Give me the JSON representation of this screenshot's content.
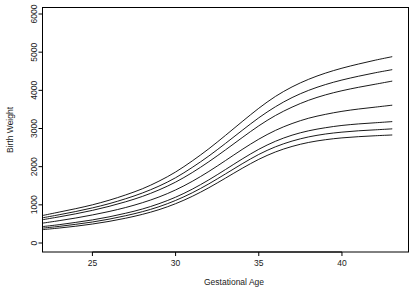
{
  "chart_data": {
    "type": "line",
    "title": "",
    "xlabel": "Gestational Age",
    "ylabel": "Birth Weight",
    "xlim": [
      22,
      44
    ],
    "ylim": [
      0,
      6000
    ],
    "xticks": [
      25,
      30,
      35,
      40
    ],
    "yticks": [
      0,
      1000,
      2000,
      3000,
      4000,
      5000,
      6000
    ],
    "xtick_labels": [
      "25",
      "30",
      "35",
      "40"
    ],
    "ytick_labels": [
      "0",
      "1000",
      "2000",
      "3000",
      "4000",
      "5000",
      "6000"
    ],
    "grid": false,
    "legend": false,
    "line_color": "#000000",
    "box_color": "#000000",
    "x": [
      22,
      23,
      24,
      25,
      26,
      27,
      28,
      29,
      30,
      31,
      32,
      33,
      34,
      35,
      36,
      37,
      38,
      39,
      40,
      41,
      42,
      43
    ],
    "series": [
      {
        "name": "curve-1",
        "values": [
          720,
          810,
          900,
          1000,
          1120,
          1260,
          1420,
          1620,
          1860,
          2150,
          2470,
          2820,
          3180,
          3530,
          3840,
          4090,
          4290,
          4450,
          4580,
          4690,
          4790,
          4880
        ]
      },
      {
        "name": "curve-2",
        "values": [
          660,
          740,
          825,
          920,
          1030,
          1160,
          1310,
          1490,
          1710,
          1980,
          2280,
          2610,
          2950,
          3280,
          3570,
          3810,
          4000,
          4150,
          4270,
          4370,
          4460,
          4540
        ]
      },
      {
        "name": "curve-3",
        "values": [
          610,
          685,
          765,
          855,
          960,
          1080,
          1220,
          1390,
          1595,
          1845,
          2130,
          2440,
          2760,
          3070,
          3340,
          3560,
          3740,
          3880,
          3990,
          4080,
          4160,
          4240
        ]
      },
      {
        "name": "curve-4",
        "values": [
          520,
          585,
          655,
          735,
          825,
          930,
          1055,
          1205,
          1390,
          1615,
          1875,
          2160,
          2450,
          2720,
          2950,
          3130,
          3270,
          3370,
          3450,
          3510,
          3560,
          3610
        ]
      },
      {
        "name": "curve-5",
        "values": [
          430,
          480,
          540,
          605,
          685,
          780,
          890,
          1030,
          1200,
          1410,
          1655,
          1925,
          2200,
          2455,
          2665,
          2825,
          2940,
          3020,
          3080,
          3120,
          3150,
          3180
        ]
      },
      {
        "name": "curve-6",
        "values": [
          390,
          435,
          490,
          550,
          625,
          715,
          820,
          950,
          1115,
          1315,
          1550,
          1810,
          2075,
          2320,
          2520,
          2670,
          2780,
          2855,
          2905,
          2940,
          2965,
          2990
        ]
      },
      {
        "name": "curve-7",
        "values": [
          350,
          392,
          440,
          497,
          566,
          650,
          750,
          873,
          1030,
          1222,
          1448,
          1700,
          1956,
          2192,
          2385,
          2530,
          2635,
          2706,
          2754,
          2786,
          2810,
          2830
        ]
      }
    ]
  },
  "axes": {
    "xlabel": "Gestational Age",
    "ylabel": "Birth Weight"
  }
}
